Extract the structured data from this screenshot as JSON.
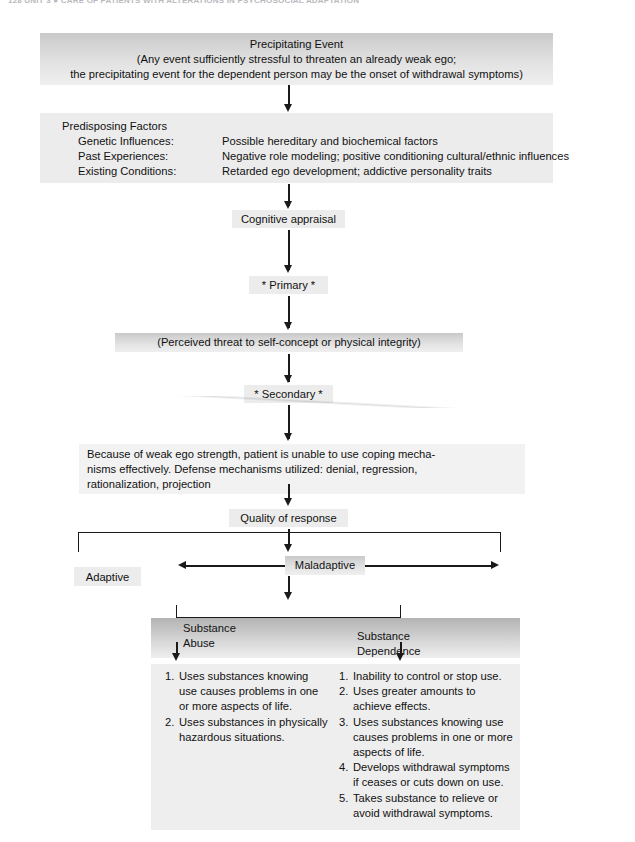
{
  "page": {
    "running_head": "128   UNIT 3 ● CARE OF PATIENTS WITH ALTERATIONS IN PSYCHOSOCIAL ADAPTATION",
    "background": "#ffffff",
    "ink": "#1a1a1a"
  },
  "flow": {
    "precipitating_event": {
      "title": "Precipitating Event",
      "line2": "(Any event sufficiently stressful to threaten an already weak ego;",
      "line3": "the precipitating event for the dependent person may be the onset of withdrawal symptoms)"
    },
    "predisposing_factors": {
      "title": "Predisposing Factors",
      "rows": [
        {
          "label": "Genetic Influences:",
          "value": "Possible hereditary and biochemical factors"
        },
        {
          "label": "Past Experiences:",
          "value": "Negative role modeling; positive conditioning cultural/ethnic influences"
        },
        {
          "label": "Existing Conditions:",
          "value": "Retarded ego development; addictive personality traits"
        }
      ]
    },
    "cognitive_appraisal": "Cognitive appraisal",
    "primary": "* Primary *",
    "perceived_threat": "(Perceived threat to self-concept or physical integrity)",
    "secondary": "* Secondary *",
    "coping": {
      "line1": "Because of weak ego strength, patient is unable to use coping mecha-",
      "line2": "nisms effectively. Defense mechanisms utilized: denial, regression,",
      "line3": "rationalization, projection"
    },
    "quality_of_response": "Quality of response",
    "adaptive": "Adaptive",
    "maladaptive": "Maladaptive"
  },
  "outcomes": {
    "left": {
      "heading_line1": "Substance",
      "heading_line2": "Abuse",
      "items": [
        {
          "num": "1.",
          "lines": [
            "Uses substances knowing",
            "use causes problems in one",
            "or more aspects of life."
          ]
        },
        {
          "num": "2.",
          "lines": [
            "Uses substances in physically",
            "hazardous situations."
          ]
        }
      ]
    },
    "right": {
      "heading_line1": "Substance",
      "heading_line2": "Dependence",
      "items": [
        {
          "num": "1.",
          "lines": [
            "Inability to control or stop use."
          ]
        },
        {
          "num": "2.",
          "lines": [
            "Uses greater amounts to",
            "achieve effects."
          ]
        },
        {
          "num": "3.",
          "lines": [
            "Uses substances knowing use",
            "causes problems in one or more",
            "aspects of life."
          ]
        },
        {
          "num": "4.",
          "lines": [
            "Develops withdrawal symptoms",
            "if ceases or cuts down on use."
          ]
        },
        {
          "num": "5.",
          "lines": [
            "Takes substance to relieve or",
            "avoid withdrawal symptoms."
          ]
        }
      ]
    }
  }
}
